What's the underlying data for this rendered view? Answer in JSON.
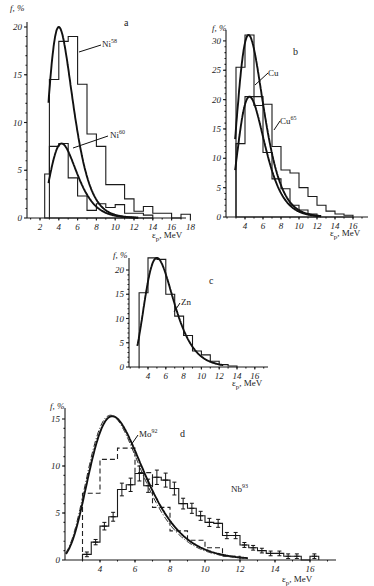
{
  "chart_data": [
    {
      "panel": "a",
      "type": "bar",
      "title": "a",
      "xlabel": "ε_p, MeV",
      "ylabel": "f, %",
      "xlim": [
        0,
        19
      ],
      "ylim": [
        0,
        20
      ],
      "xticks": [
        2,
        4,
        6,
        8,
        10,
        12,
        14,
        16,
        18
      ],
      "yticks": [
        0,
        5,
        10,
        15,
        20
      ],
      "series": [
        {
          "name": "Ni58",
          "label": "Ni",
          "superscript": "58",
          "style": "open-histogram",
          "bin_edges": [
            3,
            4,
            5,
            6,
            7,
            8,
            9,
            10,
            11,
            12,
            13,
            14,
            15,
            16,
            17,
            18
          ],
          "values": [
            14.5,
            18.5,
            19.0,
            14.0,
            8.8,
            7.5,
            3.5,
            3.5,
            2.0,
            0.7,
            1.2,
            0.5,
            0.5,
            0,
            0.4
          ]
        },
        {
          "name": "Ni60",
          "label": "Ni",
          "superscript": "60",
          "style": "hatched-histogram",
          "bin_edges": [
            2.5,
            3,
            4,
            5,
            6,
            7,
            8,
            9,
            10,
            11,
            12,
            13,
            14
          ],
          "values": [
            4.6,
            7.5,
            7.8,
            4.2,
            2.3,
            0.8,
            1.5,
            1.1,
            1.4,
            0.5,
            0.5,
            0.3
          ]
        },
        {
          "name": "Ni58 calc",
          "style": "curve",
          "peak_x": 4.0,
          "peak_y": 20.0
        },
        {
          "name": "Ni60 calc",
          "style": "curve",
          "peak_x": 4.3,
          "peak_y": 7.8
        }
      ]
    },
    {
      "panel": "b",
      "type": "bar",
      "title": "b",
      "xlabel": "ε_p, MeV",
      "ylabel": "f, %",
      "xlim": [
        2,
        18
      ],
      "ylim": [
        0,
        30
      ],
      "xticks": [
        4,
        6,
        8,
        10,
        12,
        14,
        16
      ],
      "yticks": [
        0,
        5,
        10,
        15,
        20,
        25,
        30
      ],
      "series": [
        {
          "name": "Cu",
          "label": "Cu",
          "superscript": "",
          "style": "open-histogram",
          "bin_edges": [
            3,
            4,
            5,
            6,
            7,
            8,
            9,
            10,
            11,
            12
          ],
          "values": [
            25.5,
            31.0,
            20.5,
            11.0,
            6.5,
            4.8,
            2.0,
            1.2,
            0.5
          ]
        },
        {
          "name": "Cu65",
          "label": "Cu",
          "superscript": "65",
          "style": "hatched-histogram",
          "bin_edges": [
            3,
            4,
            5,
            6,
            7,
            8,
            9,
            10,
            11,
            12,
            13,
            14,
            15,
            16
          ],
          "values": [
            12.5,
            20.5,
            19.0,
            19.2,
            12.0,
            8.0,
            7.5,
            5.0,
            3.5,
            2.0,
            1.0,
            0.5,
            0.3
          ]
        },
        {
          "name": "Cu calc",
          "style": "curve",
          "peak_x": 4.4,
          "peak_y": 31.0
        },
        {
          "name": "Cu65 calc",
          "style": "curve",
          "peak_x": 4.5,
          "peak_y": 20.5
        }
      ]
    },
    {
      "panel": "c",
      "type": "bar",
      "title": "c",
      "xlabel": "ε_p, MeV",
      "ylabel": "f, %",
      "xlim": [
        2,
        17
      ],
      "ylim": [
        0,
        20
      ],
      "xticks": [
        4,
        6,
        8,
        10,
        12,
        14,
        16
      ],
      "yticks": [
        0,
        5,
        10,
        15,
        20
      ],
      "series": [
        {
          "name": "Zn",
          "label": "Zn",
          "superscript": "",
          "style": "open-histogram",
          "bin_edges": [
            3,
            4,
            5,
            6,
            7,
            8,
            9,
            10,
            11,
            12,
            13,
            14
          ],
          "values": [
            15.3,
            22.5,
            22.2,
            15.0,
            10.5,
            6.5,
            3.3,
            2.5,
            1.2,
            0.5,
            0.2
          ]
        },
        {
          "name": "Zn calc",
          "style": "curve",
          "peak_x": 5.0,
          "peak_y": 22.5
        }
      ]
    },
    {
      "panel": "d",
      "type": "bar",
      "title": "d",
      "xlabel": "ε_p, MeV",
      "ylabel": "f, %",
      "xlim": [
        2,
        17
      ],
      "ylim": [
        0,
        15
      ],
      "xticks": [
        4,
        6,
        8,
        10,
        12,
        14,
        16
      ],
      "yticks": [
        0,
        5,
        10,
        15
      ],
      "series": [
        {
          "name": "Mo92",
          "label": "Mo",
          "superscript": "92",
          "style": "dashed-histogram",
          "bin_edges": [
            3,
            4,
            5,
            6,
            7,
            8,
            9,
            10,
            11,
            12
          ],
          "values": [
            7.1,
            10.7,
            11.9,
            9.3,
            5.6,
            3.1,
            2.1,
            1.3,
            0.4
          ]
        },
        {
          "name": "Nb93",
          "label": "Nb",
          "superscript": "93",
          "style": "histogram-with-errorbars",
          "bin_edges": [
            3,
            3.5,
            4,
            4.5,
            5,
            5.5,
            6,
            6.5,
            7,
            7.5,
            8,
            8.5,
            9,
            9.5,
            10,
            10.5,
            11,
            11.5,
            12,
            12.5,
            13,
            13.5,
            14,
            14.5,
            15,
            15.5,
            16,
            16.5
          ],
          "values": [
            0.6,
            1.9,
            3.6,
            4.6,
            7.5,
            8.0,
            9.2,
            7.9,
            8.8,
            8.5,
            7.6,
            6.0,
            5.5,
            4.7,
            4.0,
            3.9,
            2.6,
            2.6,
            1.6,
            1.3,
            1.0,
            0.7,
            0.7,
            0.4,
            0.4,
            0,
            0.4
          ]
        },
        {
          "name": "Calc solid",
          "style": "curve",
          "peak_x": 4.7,
          "peak_y": 15.3
        },
        {
          "name": "Calc dash-dot",
          "style": "curve-dashdot",
          "peak_x": 4.6,
          "peak_y": 15.4
        }
      ]
    }
  ],
  "labels": {
    "y_axis_label": "f, %",
    "x_axis_label": "ε",
    "x_axis_sub": "p",
    "x_axis_unit": ", MeV"
  }
}
